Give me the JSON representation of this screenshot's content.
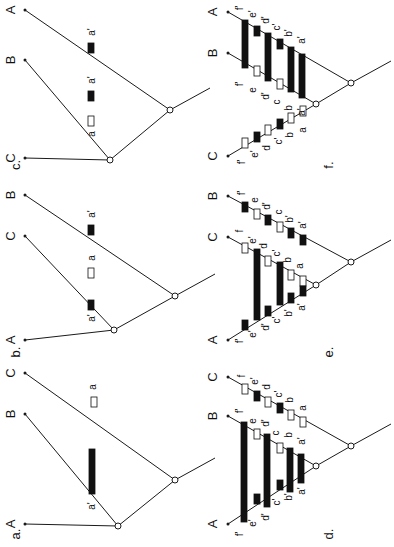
{
  "figure": {
    "background": "#ffffff",
    "ink": "#111111",
    "rotation_deg": -90,
    "note": "All text rendered rotated 90 degrees counter-clockwise"
  },
  "panels": [
    {
      "id": "a",
      "caption": "a.",
      "caption_pos": [
        17,
        534
      ],
      "root": [
        175,
        480
      ],
      "inner": [
        118,
        526
      ],
      "tips": [
        {
          "label": "A",
          "pos": [
            25,
            524
          ],
          "label_pos": [
            12,
            524
          ]
        },
        {
          "label": "B",
          "pos": [
            25,
            414
          ],
          "label_pos": [
            12,
            414
          ]
        },
        {
          "label": "C",
          "pos": [
            25,
            373
          ],
          "label_pos": [
            12,
            373
          ]
        }
      ],
      "marks": [
        {
          "type": "open",
          "x": 91,
          "y": 397,
          "w": 6,
          "h": 10,
          "label": "a",
          "label_pos": [
            93,
            387
          ]
        }
      ],
      "bars": [
        {
          "x": 89,
          "y": 449,
          "w": 6,
          "h": 45
        }
      ],
      "bar_labels": [
        {
          "text": "a'",
          "pos": [
            92,
            506
          ]
        }
      ]
    },
    {
      "id": "b",
      "caption": "b.",
      "caption_pos": [
        17,
        352
      ],
      "root": [
        175,
        296
      ],
      "inner": [
        114,
        330
      ],
      "tips": [
        {
          "label": "A",
          "pos": [
            25,
            340
          ],
          "label_pos": [
            12,
            340
          ]
        },
        {
          "label": "C",
          "pos": [
            25,
            236
          ],
          "label_pos": [
            12,
            236
          ]
        },
        {
          "label": "B",
          "pos": [
            25,
            195
          ],
          "label_pos": [
            12,
            195
          ]
        }
      ],
      "marks": [
        {
          "type": "fill",
          "x": 88,
          "y": 300,
          "w": 6,
          "h": 10,
          "label": "a'",
          "label_pos": [
            92,
            318
          ]
        },
        {
          "type": "open",
          "x": 88,
          "y": 268,
          "w": 6,
          "h": 10,
          "label": "a",
          "label_pos": [
            92,
            258
          ]
        },
        {
          "type": "fill",
          "x": 88,
          "y": 225,
          "w": 6,
          "h": 10,
          "label": "a'",
          "label_pos": [
            92,
            214
          ]
        }
      ],
      "bars": [],
      "bar_labels": []
    },
    {
      "id": "c",
      "caption": "c.",
      "caption_pos": [
        17,
        165
      ],
      "root": [
        170,
        110
      ],
      "inner": [
        110,
        160
      ],
      "tips": [
        {
          "label": "C",
          "pos": [
            25,
            158
          ],
          "label_pos": [
            12,
            158
          ]
        },
        {
          "label": "B",
          "pos": [
            25,
            60
          ],
          "label_pos": [
            12,
            60
          ]
        },
        {
          "label": "A",
          "pos": [
            25,
            10
          ],
          "label_pos": [
            12,
            10
          ]
        }
      ],
      "marks": [
        {
          "type": "open",
          "x": 88,
          "y": 116,
          "w": 6,
          "h": 10,
          "label": "a",
          "label_pos": [
            92,
            134
          ]
        },
        {
          "type": "fill",
          "x": 88,
          "y": 91,
          "w": 6,
          "h": 10,
          "label": "a'",
          "label_pos": [
            92,
            80
          ]
        },
        {
          "type": "fill",
          "x": 88,
          "y": 43,
          "w": 6,
          "h": 10,
          "label": "a'",
          "label_pos": [
            92,
            32
          ]
        }
      ],
      "bars": [],
      "bar_labels": []
    },
    {
      "id": "d",
      "caption": "d.",
      "caption_pos": [
        330,
        534
      ],
      "root": [
        351,
        446
      ],
      "inner": [
        316,
        466
      ],
      "tips": [
        {
          "label": "A",
          "pos": [
            228,
            524
          ],
          "label_pos": [
            214,
            524
          ]
        },
        {
          "label": "B",
          "pos": [
            228,
            416
          ],
          "label_pos": [
            214,
            416
          ]
        },
        {
          "label": "C",
          "pos": [
            228,
            377
          ],
          "label_pos": [
            214,
            377
          ]
        }
      ],
      "marks": [
        {
          "type": "open",
          "x": 242,
          "y": 384,
          "w": 6,
          "h": 10,
          "label": "f",
          "label_pos": [
            242,
            376
          ]
        },
        {
          "type": "fill",
          "x": 254,
          "y": 391,
          "w": 6,
          "h": 10,
          "label": "e'",
          "label_pos": [
            255,
            381
          ]
        },
        {
          "type": "open",
          "x": 265,
          "y": 397,
          "w": 6,
          "h": 10,
          "label": "d",
          "label_pos": [
            267,
            387
          ]
        },
        {
          "type": "fill",
          "x": 277,
          "y": 403,
          "w": 6,
          "h": 10,
          "label": "c'",
          "label_pos": [
            279,
            394
          ]
        },
        {
          "type": "open",
          "x": 288,
          "y": 410,
          "w": 6,
          "h": 10,
          "label": "b",
          "label_pos": [
            290,
            400
          ]
        },
        {
          "type": "open",
          "x": 300,
          "y": 417,
          "w": 6,
          "h": 10,
          "label": "a",
          "label_pos": [
            303,
            408
          ]
        },
        {
          "type": "open",
          "x": 254,
          "y": 429,
          "w": 6,
          "h": 10,
          "label": "e",
          "label_pos": [
            253,
            421
          ]
        },
        {
          "type": "open",
          "x": 277,
          "y": 443,
          "w": 6,
          "h": 10,
          "label": "c",
          "label_pos": [
            276,
            433
          ]
        },
        {
          "type": "fill",
          "x": 254,
          "y": 494,
          "w": 6,
          "h": 10,
          "label": "",
          "label_pos": [
            0,
            0
          ]
        },
        {
          "type": "fill",
          "x": 277,
          "y": 480,
          "w": 6,
          "h": 10,
          "label": "",
          "label_pos": [
            0,
            0
          ]
        }
      ],
      "bars": [
        {
          "x": 241,
          "y": 422,
          "w": 6,
          "h": 100
        },
        {
          "x": 264,
          "y": 434,
          "w": 6,
          "h": 73
        },
        {
          "x": 287,
          "y": 448,
          "w": 6,
          "h": 44
        },
        {
          "x": 298,
          "y": 454,
          "w": 6,
          "h": 29
        }
      ],
      "bar_labels": [
        {
          "text": "f'",
          "pos": [
            240,
            534
          ]
        },
        {
          "text": "e'",
          "pos": [
            253,
            523
          ]
        },
        {
          "text": "d'",
          "pos": [
            266,
            517
          ]
        },
        {
          "text": "c'",
          "pos": [
            277,
            502
          ]
        },
        {
          "text": "b'",
          "pos": [
            289,
            497
          ]
        },
        {
          "text": "a'",
          "pos": [
            302,
            491
          ]
        },
        {
          "text": "f'",
          "pos": [
            240,
            411
          ]
        },
        {
          "text": "d'",
          "pos": [
            266,
            423
          ]
        },
        {
          "text": "b",
          "pos": [
            289,
            435
          ]
        },
        {
          "text": "a'",
          "pos": [
            302,
            441
          ]
        }
      ]
    },
    {
      "id": "e",
      "caption": "e.",
      "caption_pos": [
        330,
        352
      ],
      "root": [
        351,
        262
      ],
      "inner": [
        316,
        285
      ],
      "tips": [
        {
          "label": "A",
          "pos": [
            228,
            340
          ],
          "label_pos": [
            214,
            340
          ]
        },
        {
          "label": "C",
          "pos": [
            228,
            237
          ],
          "label_pos": [
            214,
            237
          ]
        },
        {
          "label": "B",
          "pos": [
            228,
            196
          ],
          "label_pos": [
            214,
            196
          ]
        }
      ],
      "marks": [
        {
          "type": "fill",
          "x": 242,
          "y": 202,
          "w": 6,
          "h": 10,
          "label": "f'",
          "label_pos": [
            242,
            193
          ]
        },
        {
          "type": "open",
          "x": 254,
          "y": 209,
          "w": 6,
          "h": 10,
          "label": "e",
          "label_pos": [
            255,
            200
          ]
        },
        {
          "type": "fill",
          "x": 265,
          "y": 215,
          "w": 6,
          "h": 10,
          "label": "d'",
          "label_pos": [
            267,
            206
          ]
        },
        {
          "type": "open",
          "x": 277,
          "y": 222,
          "w": 6,
          "h": 10,
          "label": "c",
          "label_pos": [
            279,
            212
          ]
        },
        {
          "type": "fill",
          "x": 288,
          "y": 228,
          "w": 6,
          "h": 10,
          "label": "b'",
          "label_pos": [
            290,
            219
          ]
        },
        {
          "type": "fill",
          "x": 300,
          "y": 235,
          "w": 6,
          "h": 10,
          "label": "a'",
          "label_pos": [
            303,
            225
          ]
        },
        {
          "type": "open",
          "x": 242,
          "y": 243,
          "w": 6,
          "h": 10,
          "label": "f",
          "label_pos": [
            240,
            231
          ]
        },
        {
          "type": "open",
          "x": 265,
          "y": 256,
          "w": 6,
          "h": 10,
          "label": "d",
          "label_pos": [
            264,
            246
          ]
        },
        {
          "type": "open",
          "x": 288,
          "y": 270,
          "w": 6,
          "h": 10,
          "label": "b",
          "label_pos": [
            288,
            260
          ]
        },
        {
          "type": "open",
          "x": 300,
          "y": 276,
          "w": 6,
          "h": 10,
          "label": "a",
          "label_pos": [
            300,
            266
          ]
        },
        {
          "type": "fill",
          "x": 242,
          "y": 320,
          "w": 6,
          "h": 10,
          "label": "",
          "label_pos": [
            0,
            0
          ]
        },
        {
          "type": "fill",
          "x": 265,
          "y": 306,
          "w": 6,
          "h": 10,
          "label": "",
          "label_pos": [
            0,
            0
          ]
        },
        {
          "type": "fill",
          "x": 288,
          "y": 293,
          "w": 6,
          "h": 10,
          "label": "",
          "label_pos": [
            0,
            0
          ]
        },
        {
          "type": "fill",
          "x": 300,
          "y": 286,
          "w": 6,
          "h": 10,
          "label": "",
          "label_pos": [
            0,
            0
          ]
        }
      ],
      "bars": [
        {
          "x": 254,
          "y": 249,
          "w": 6,
          "h": 71
        },
        {
          "x": 277,
          "y": 262,
          "w": 6,
          "h": 43
        }
      ],
      "bar_labels": [
        {
          "text": "f'",
          "pos": [
            240,
            341
          ]
        },
        {
          "text": "e'",
          "pos": [
            253,
            334
          ]
        },
        {
          "text": "d'",
          "pos": [
            266,
            327
          ]
        },
        {
          "text": "c'",
          "pos": [
            277,
            320
          ]
        },
        {
          "text": "b'",
          "pos": [
            289,
            313
          ]
        },
        {
          "text": "a'",
          "pos": [
            302,
            307
          ]
        },
        {
          "text": "e'",
          "pos": [
            253,
            240
          ]
        },
        {
          "text": "c'",
          "pos": [
            277,
            253
          ]
        }
      ]
    },
    {
      "id": "f",
      "caption": "f.",
      "caption_pos": [
        330,
        165
      ],
      "root": [
        351,
        83
      ],
      "inner": [
        316,
        104
      ],
      "tips": [
        {
          "label": "C",
          "pos": [
            228,
            156
          ],
          "label_pos": [
            214,
            156
          ]
        },
        {
          "label": "B",
          "pos": [
            228,
            53
          ],
          "label_pos": [
            214,
            53
          ]
        },
        {
          "label": "A",
          "pos": [
            228,
            12
          ],
          "label_pos": [
            214,
            12
          ]
        }
      ],
      "marks": [
        {
          "type": "open",
          "x": 242,
          "y": 138,
          "w": 6,
          "h": 10,
          "label": "f'",
          "label_pos": [
            242,
            162
          ]
        },
        {
          "type": "fill",
          "x": 254,
          "y": 132,
          "w": 6,
          "h": 10,
          "label": "e'",
          "label_pos": [
            255,
            154
          ]
        },
        {
          "type": "open",
          "x": 265,
          "y": 125,
          "w": 6,
          "h": 10,
          "label": "d",
          "label_pos": [
            267,
            148
          ]
        },
        {
          "type": "fill",
          "x": 277,
          "y": 119,
          "w": 6,
          "h": 10,
          "label": "c'",
          "label_pos": [
            279,
            141
          ]
        },
        {
          "type": "open",
          "x": 288,
          "y": 113,
          "w": 6,
          "h": 10,
          "label": "b",
          "label_pos": [
            290,
            135
          ]
        },
        {
          "type": "open",
          "x": 300,
          "y": 106,
          "w": 6,
          "h": 10,
          "label": "a",
          "label_pos": [
            303,
            130
          ]
        },
        {
          "type": "open",
          "x": 254,
          "y": 66,
          "w": 6,
          "h": 10,
          "label": "",
          "label_pos": [
            0,
            0
          ]
        },
        {
          "type": "open",
          "x": 277,
          "y": 79,
          "w": 6,
          "h": 10,
          "label": "",
          "label_pos": [
            0,
            0
          ]
        },
        {
          "type": "fill",
          "x": 254,
          "y": 26,
          "w": 6,
          "h": 10,
          "label": "",
          "label_pos": [
            0,
            0
          ]
        },
        {
          "type": "fill",
          "x": 277,
          "y": 39,
          "w": 6,
          "h": 10,
          "label": "",
          "label_pos": [
            0,
            0
          ]
        }
      ],
      "bars": [
        {
          "x": 242,
          "y": 20,
          "w": 6,
          "h": 48
        },
        {
          "x": 265,
          "y": 33,
          "w": 6,
          "h": 48
        },
        {
          "x": 288,
          "y": 47,
          "w": 6,
          "h": 45
        },
        {
          "x": 299,
          "y": 54,
          "w": 6,
          "h": 44
        }
      ],
      "bar_labels": [
        {
          "text": "f'",
          "pos": [
            240,
            8
          ]
        },
        {
          "text": "e'",
          "pos": [
            253,
            14
          ]
        },
        {
          "text": "d'",
          "pos": [
            266,
            20
          ]
        },
        {
          "text": "c'",
          "pos": [
            277,
            27
          ]
        },
        {
          "text": "b'",
          "pos": [
            289,
            33
          ]
        },
        {
          "text": "a'",
          "pos": [
            302,
            40
          ]
        },
        {
          "text": "f'",
          "pos": [
            240,
            84
          ]
        },
        {
          "text": "e",
          "pos": [
            253,
            90
          ]
        },
        {
          "text": "d'",
          "pos": [
            266,
            96
          ]
        },
        {
          "text": "c",
          "pos": [
            277,
            102
          ]
        },
        {
          "text": "b",
          "pos": [
            289,
            108
          ]
        },
        {
          "text": "a'",
          "pos": [
            302,
            112
          ]
        }
      ]
    }
  ]
}
